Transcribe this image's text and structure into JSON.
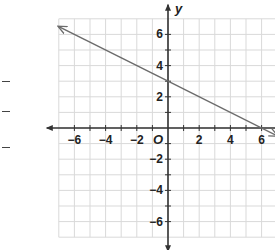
{
  "chart_data": {
    "type": "line",
    "title": "",
    "xlabel": "x",
    "ylabel": "y",
    "origin_label": "O",
    "xlim": [
      -7,
      7
    ],
    "ylim": [
      -7,
      7
    ],
    "grid": true,
    "x_ticks": [
      "-6",
      "-4",
      "-2",
      "2",
      "4",
      "6"
    ],
    "y_ticks": [
      "6",
      "4",
      "2",
      "-2",
      "-4",
      "-6"
    ],
    "series": [
      {
        "name": "line",
        "equation": "y = -x/2 + 3",
        "x": [
          -7,
          0,
          6,
          7
        ],
        "y": [
          6.5,
          3,
          0,
          -0.5
        ],
        "arrows": "both",
        "color": "#6b6b6b"
      }
    ]
  },
  "colors": {
    "grid": "#d9d9d9",
    "axis": "#333333",
    "line": "#6b6b6b"
  }
}
